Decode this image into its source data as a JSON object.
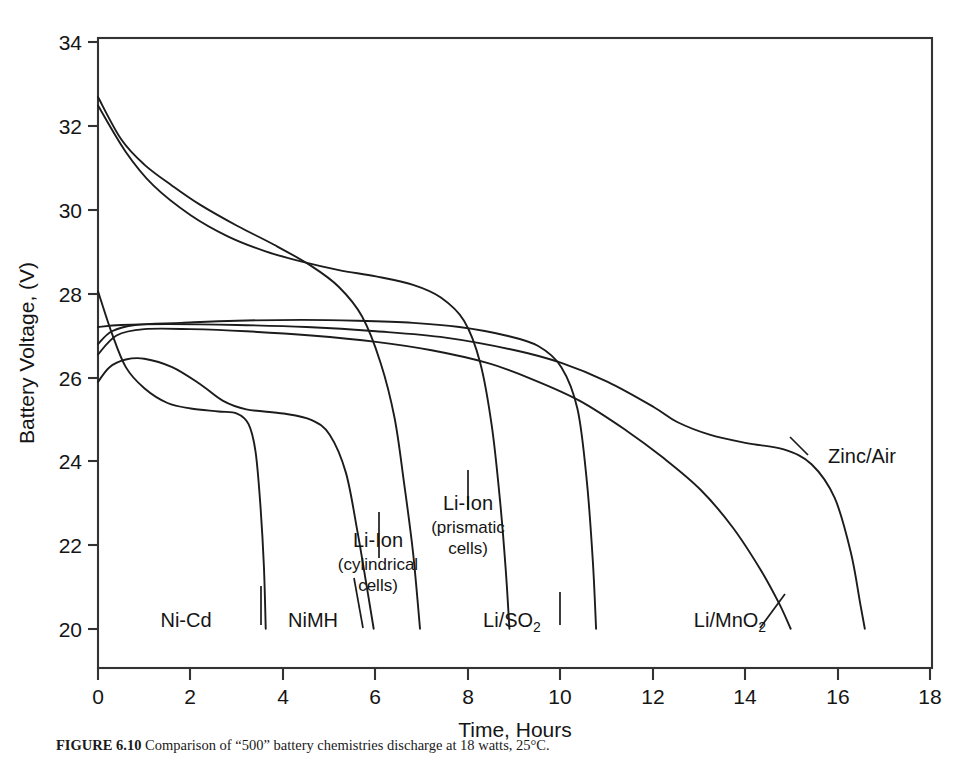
{
  "figure": {
    "caption_label": "FIGURE 6.10",
    "caption_text": "Comparison of “500” battery chemistries discharge at 18 watts, 25°C."
  },
  "axes": {
    "x_title": "Time, Hours",
    "y_title": "Battery Voltage, (V)",
    "x_ticks": [
      "0",
      "2",
      "4",
      "6",
      "8",
      "10",
      "12",
      "14",
      "16",
      "18"
    ],
    "y_ticks": [
      "20",
      "22",
      "24",
      "26",
      "28",
      "30",
      "32",
      "34"
    ]
  },
  "labels": {
    "ni_cd": "Ni-Cd",
    "nimh": "NiMH",
    "li_ion_cyl_main": "Li-Ion",
    "li_ion_cyl_sub1": "(cylindrical",
    "li_ion_cyl_sub2": "cells)",
    "li_ion_pris_main": "Li-Ion",
    "li_ion_pris_sub1": "(prismatic",
    "li_ion_pris_sub2": "cells)",
    "li_so2_main": "Li/SO",
    "li_so2_sub": "2",
    "li_mno2_main": "Li/MnO",
    "li_mno2_sub": "2",
    "zinc_air": "Zinc/Air"
  },
  "colors": {
    "line": "#1c1c1c",
    "axis": "#333333",
    "background": "#ffffff"
  },
  "chart_data": {
    "type": "line",
    "title": "",
    "xlabel": "Time, Hours",
    "ylabel": "Battery Voltage, (V)",
    "xlim": [
      0,
      18
    ],
    "ylim": [
      19.07,
      34
    ],
    "xticks": [
      0,
      2,
      4,
      6,
      8,
      10,
      12,
      14,
      16,
      18
    ],
    "yticks": [
      20,
      22,
      24,
      26,
      28,
      30,
      32,
      34
    ],
    "grid": false,
    "legend": "inline-annotations",
    "series": [
      {
        "name": "Ni-Cd",
        "points": [
          [
            0,
            28.0
          ],
          [
            0.3,
            27.0
          ],
          [
            0.6,
            26.2
          ],
          [
            1.0,
            25.7
          ],
          [
            1.5,
            25.35
          ],
          [
            2.0,
            25.22
          ],
          [
            2.6,
            25.15
          ],
          [
            3.0,
            25.1
          ],
          [
            3.25,
            24.85
          ],
          [
            3.4,
            24.2
          ],
          [
            3.5,
            23.0
          ],
          [
            3.58,
            21.5
          ],
          [
            3.62,
            20.0
          ]
        ]
      },
      {
        "name": "NiMH",
        "points": [
          [
            0,
            25.85
          ],
          [
            0.25,
            26.2
          ],
          [
            0.6,
            26.38
          ],
          [
            1.0,
            26.4
          ],
          [
            1.6,
            26.2
          ],
          [
            2.2,
            25.8
          ],
          [
            2.7,
            25.4
          ],
          [
            3.2,
            25.2
          ],
          [
            4.0,
            25.1
          ],
          [
            4.6,
            24.95
          ],
          [
            5.0,
            24.6
          ],
          [
            5.35,
            23.7
          ],
          [
            5.6,
            22.3
          ],
          [
            5.8,
            21.0
          ],
          [
            5.95,
            20.0
          ]
        ]
      },
      {
        "name": "Li-Ion (cylindrical cells)",
        "points": [
          [
            0,
            32.6
          ],
          [
            0.5,
            31.6
          ],
          [
            1.0,
            31.0
          ],
          [
            1.6,
            30.5
          ],
          [
            2.2,
            30.05
          ],
          [
            3.0,
            29.55
          ],
          [
            3.8,
            29.1
          ],
          [
            4.6,
            28.6
          ],
          [
            5.2,
            28.1
          ],
          [
            5.7,
            27.4
          ],
          [
            6.1,
            26.3
          ],
          [
            6.4,
            25.0
          ],
          [
            6.6,
            23.5
          ],
          [
            6.8,
            21.8
          ],
          [
            6.95,
            20.0
          ]
        ]
      },
      {
        "name": "Li-Ion (prismatic cells)",
        "points": [
          [
            0,
            32.4
          ],
          [
            0.6,
            31.3
          ],
          [
            1.2,
            30.5
          ],
          [
            2.0,
            29.8
          ],
          [
            2.8,
            29.3
          ],
          [
            3.6,
            28.95
          ],
          [
            4.4,
            28.7
          ],
          [
            5.2,
            28.5
          ],
          [
            6.0,
            28.35
          ],
          [
            6.8,
            28.15
          ],
          [
            7.4,
            27.85
          ],
          [
            7.9,
            27.3
          ],
          [
            8.25,
            26.3
          ],
          [
            8.5,
            24.8
          ],
          [
            8.68,
            23.0
          ],
          [
            8.8,
            21.4
          ],
          [
            8.88,
            20.0
          ]
        ]
      },
      {
        "name": "Li/SO2",
        "points": [
          [
            0,
            26.75
          ],
          [
            0.3,
            27.05
          ],
          [
            0.8,
            27.2
          ],
          [
            1.8,
            27.25
          ],
          [
            3.0,
            27.3
          ],
          [
            4.4,
            27.32
          ],
          [
            5.6,
            27.3
          ],
          [
            6.8,
            27.25
          ],
          [
            7.8,
            27.15
          ],
          [
            8.8,
            26.95
          ],
          [
            9.5,
            26.7
          ],
          [
            10.0,
            26.2
          ],
          [
            10.35,
            25.2
          ],
          [
            10.55,
            23.5
          ],
          [
            10.68,
            21.6
          ],
          [
            10.75,
            20.0
          ]
        ]
      },
      {
        "name": "Li/MnO2",
        "points": [
          [
            0,
            26.5
          ],
          [
            0.4,
            26.95
          ],
          [
            1.0,
            27.1
          ],
          [
            2.0,
            27.1
          ],
          [
            3.2,
            27.05
          ],
          [
            4.6,
            26.95
          ],
          [
            6.0,
            26.8
          ],
          [
            7.2,
            26.6
          ],
          [
            8.4,
            26.3
          ],
          [
            9.4,
            25.9
          ],
          [
            10.4,
            25.4
          ],
          [
            11.4,
            24.7
          ],
          [
            12.2,
            24.05
          ],
          [
            13.0,
            23.3
          ],
          [
            13.7,
            22.4
          ],
          [
            14.3,
            21.4
          ],
          [
            14.7,
            20.6
          ],
          [
            14.95,
            20.0
          ]
        ]
      },
      {
        "name": "Zinc/Air",
        "points": [
          [
            0,
            27.15
          ],
          [
            0.5,
            27.2
          ],
          [
            1.5,
            27.22
          ],
          [
            3.0,
            27.2
          ],
          [
            4.5,
            27.15
          ],
          [
            6.0,
            27.05
          ],
          [
            7.5,
            26.9
          ],
          [
            9.0,
            26.6
          ],
          [
            10.0,
            26.3
          ],
          [
            11.0,
            25.85
          ],
          [
            12.0,
            25.25
          ],
          [
            12.5,
            24.9
          ],
          [
            13.2,
            24.6
          ],
          [
            14.0,
            24.4
          ],
          [
            14.8,
            24.25
          ],
          [
            15.4,
            23.9
          ],
          [
            15.9,
            23.1
          ],
          [
            16.25,
            21.8
          ],
          [
            16.45,
            20.6
          ],
          [
            16.55,
            20.0
          ]
        ]
      }
    ],
    "annotations": [
      {
        "text": "Ni-Cd",
        "x": 1.9,
        "y": 20.2
      },
      {
        "text": "NiMH",
        "x": 4.3,
        "y": 20.2
      },
      {
        "text": "Li-Ion (cylindrical cells)",
        "x": 6.2,
        "y": 22.4
      },
      {
        "text": "Li-Ion (prismatic cells)",
        "x": 8.5,
        "y": 23.3
      },
      {
        "text": "Li/SO2",
        "x": 9.4,
        "y": 20.2
      },
      {
        "text": "Li/MnO2",
        "x": 13.4,
        "y": 20.2
      },
      {
        "text": "Zinc/Air",
        "x": 16.0,
        "y": 24.1
      }
    ]
  }
}
